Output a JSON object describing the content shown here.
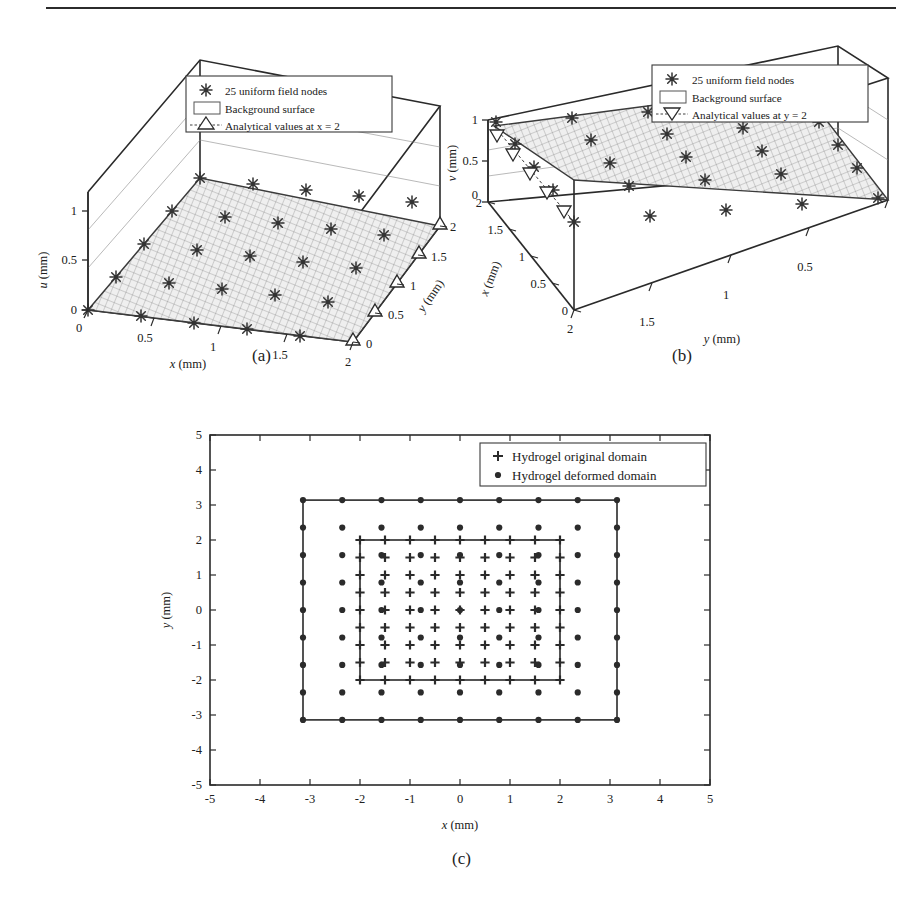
{
  "figure": {
    "top_rule": true,
    "subcaptions": [
      "(a)",
      "(b)",
      "(c)"
    ]
  },
  "panel_a": {
    "caption": "(a)",
    "z_axis": {
      "label": "u",
      "unit": "(mm)",
      "ticks": [
        "0",
        "0.5",
        "1"
      ]
    },
    "x_axis": {
      "label": "x",
      "unit": "(mm)",
      "ticks": [
        "0",
        "0.5",
        "1",
        "1.5",
        "2"
      ]
    },
    "y_axis": {
      "label": "y",
      "unit": "(mm)",
      "ticks": [
        "0",
        "0.5",
        "1",
        "1.5",
        "2"
      ]
    },
    "legend": [
      {
        "marker": "asterisk-marker",
        "label": "25 uniform field nodes"
      },
      {
        "marker": "surface-swatch",
        "label": "Background surface"
      },
      {
        "marker": "up-triangle-marker",
        "label": "Analytical values at x = 2"
      }
    ]
  },
  "panel_b": {
    "caption": "(b)",
    "z_axis": {
      "label": "v",
      "unit": "(mm)",
      "ticks": [
        "0",
        "0.5",
        "1"
      ]
    },
    "x_axis": {
      "label": "x",
      "unit": "(mm)",
      "ticks": [
        "0",
        "0.5",
        "1",
        "1.5",
        "2"
      ]
    },
    "y_axis": {
      "label": "y",
      "unit": "(mm)",
      "ticks": [
        "2",
        "1.5",
        "1",
        "0.5"
      ]
    },
    "legend": [
      {
        "marker": "asterisk-marker",
        "label": "25 uniform field nodes"
      },
      {
        "marker": "surface-swatch",
        "label": "Background surface"
      },
      {
        "marker": "down-triangle-marker",
        "label": "Analytical values at y = 2"
      }
    ]
  },
  "panel_c": {
    "caption": "(c)",
    "x_axis": {
      "label": "x",
      "unit": "(mm)",
      "ticks": [
        "-5",
        "-4",
        "-3",
        "-2",
        "-1",
        "0",
        "1",
        "2",
        "3",
        "4",
        "5"
      ]
    },
    "y_axis": {
      "label": "y",
      "unit": "(mm)",
      "ticks": [
        "-5",
        "-4",
        "-3",
        "-2",
        "-1",
        "0",
        "1",
        "2",
        "3",
        "4",
        "5"
      ]
    },
    "legend": [
      {
        "marker": "plus-marker",
        "label": "Hydrogel original domain"
      },
      {
        "marker": "dot-marker",
        "label": "Hydrogel deformed domain"
      }
    ]
  },
  "chart_data": [
    {
      "id": "panel-a",
      "type": "scatter",
      "title": "",
      "projection": "3d-surface",
      "xlabel": "x (mm)",
      "ylabel": "y (mm)",
      "zlabel": "u (mm)",
      "xlim": [
        0,
        2
      ],
      "ylim": [
        0,
        2
      ],
      "zlim": [
        0,
        1.2
      ],
      "xticks": [
        0,
        0.5,
        1,
        1.5,
        2
      ],
      "yticks": [
        0,
        0.5,
        1,
        1.5,
        2
      ],
      "zticks": [
        0,
        0.5,
        1
      ],
      "grid": true,
      "legend_position": "upper-left-inside",
      "series": [
        {
          "name": "25 uniform field nodes",
          "marker": "asterisk",
          "n": 25,
          "note": "5x5 uniform grid over x=0,0.5,1,1.5,2 and y=0,0.5,1,1.5,2; u = 0.5*x",
          "x": [
            0,
            0,
            0,
            0,
            0,
            0.5,
            0.5,
            0.5,
            0.5,
            0.5,
            1,
            1,
            1,
            1,
            1,
            1.5,
            1.5,
            1.5,
            1.5,
            1.5,
            2,
            2,
            2,
            2,
            2
          ],
          "y": [
            0,
            0.5,
            1,
            1.5,
            2,
            0,
            0.5,
            1,
            1.5,
            2,
            0,
            0.5,
            1,
            1.5,
            2,
            0,
            0.5,
            1,
            1.5,
            2,
            0,
            0.5,
            1,
            1.5,
            2
          ],
          "z": [
            0,
            0,
            0,
            0,
            0,
            0.25,
            0.25,
            0.25,
            0.25,
            0.25,
            0.5,
            0.5,
            0.5,
            0.5,
            0.5,
            0.75,
            0.75,
            0.75,
            0.75,
            0.75,
            1,
            1,
            1,
            1,
            1
          ]
        },
        {
          "name": "Background surface",
          "marker": "mesh",
          "note": "planar mesh surface u = 0.5*x over the 2x2 mm domain"
        },
        {
          "name": "Analytical values at x = 2",
          "marker": "up-triangle",
          "n": 5,
          "x": [
            2,
            2,
            2,
            2,
            2
          ],
          "y": [
            0,
            0.5,
            1,
            1.5,
            2
          ],
          "z": [
            1,
            1,
            1,
            1,
            1
          ]
        }
      ]
    },
    {
      "id": "panel-b",
      "type": "scatter",
      "title": "",
      "projection": "3d-surface",
      "xlabel": "x (mm)",
      "ylabel": "y (mm)",
      "zlabel": "v (mm)",
      "xlim": [
        0,
        2
      ],
      "ylim": [
        0,
        2
      ],
      "zlim": [
        0,
        1.2
      ],
      "xticks": [
        0,
        0.5,
        1,
        1.5,
        2
      ],
      "yticks": [
        0,
        0.5,
        1,
        1.5,
        2
      ],
      "zticks": [
        0,
        0.5,
        1
      ],
      "grid": true,
      "legend_position": "upper-right-inside",
      "series": [
        {
          "name": "25 uniform field nodes",
          "marker": "asterisk",
          "n": 25,
          "note": "5x5 uniform grid; v = 0.5*y",
          "x": [
            0,
            0,
            0,
            0,
            0,
            0.5,
            0.5,
            0.5,
            0.5,
            0.5,
            1,
            1,
            1,
            1,
            1,
            1.5,
            1.5,
            1.5,
            1.5,
            1.5,
            2,
            2,
            2,
            2,
            2
          ],
          "y": [
            0,
            0.5,
            1,
            1.5,
            2,
            0,
            0.5,
            1,
            1.5,
            2,
            0,
            0.5,
            1,
            1.5,
            2,
            0,
            0.5,
            1,
            1.5,
            2,
            0,
            0.5,
            1,
            1.5,
            2
          ],
          "z": [
            0,
            0.25,
            0.5,
            0.75,
            1,
            0,
            0.25,
            0.5,
            0.75,
            1,
            0,
            0.25,
            0.5,
            0.75,
            1,
            0,
            0.25,
            0.5,
            0.75,
            1,
            0,
            0.25,
            0.5,
            0.75,
            1
          ]
        },
        {
          "name": "Background surface",
          "marker": "mesh",
          "note": "planar mesh surface v = 0.5*y over the 2x2 mm domain"
        },
        {
          "name": "Analytical values at y = 2",
          "marker": "down-triangle",
          "n": 5,
          "x": [
            0,
            0.5,
            1,
            1.5,
            2
          ],
          "y": [
            2,
            2,
            2,
            2,
            2
          ],
          "z": [
            1,
            1,
            1,
            1,
            1
          ]
        }
      ]
    },
    {
      "id": "panel-c",
      "type": "scatter",
      "title": "",
      "xlabel": "x (mm)",
      "ylabel": "y (mm)",
      "xlim": [
        -5,
        5
      ],
      "ylim": [
        -5,
        5
      ],
      "xticks": [
        -5,
        -4,
        -3,
        -2,
        -1,
        0,
        1,
        2,
        3,
        4,
        5
      ],
      "yticks": [
        -5,
        -4,
        -3,
        -2,
        -1,
        0,
        1,
        2,
        3,
        4,
        5
      ],
      "grid": false,
      "legend_position": "upper-right-inside",
      "series": [
        {
          "name": "Hydrogel original domain",
          "marker": "plus",
          "n": 81,
          "note": "9x9 uniform grid, spacing 0.5 mm, spanning -2..2 in both x and y; outlined by inner square box from (-2,-2) to (2,2)",
          "grid_coords": [
            -2,
            -1.5,
            -1,
            -0.5,
            0,
            0.5,
            1,
            1.5,
            2
          ],
          "box": [
            -2,
            -2,
            2,
            2
          ]
        },
        {
          "name": "Hydrogel deformed domain",
          "marker": "dot",
          "n": 81,
          "note": "9x9 uniform grid, spacing ~0.785 mm, spanning -3.14..3.14 in both x and y; outlined by outer square box from (-3.14,-3.14) to (3.14,3.14)",
          "grid_coords": [
            -3.14,
            -2.355,
            -1.57,
            -0.785,
            0,
            0.785,
            1.57,
            2.355,
            3.14
          ],
          "box": [
            -3.14,
            -3.14,
            3.14,
            3.14
          ]
        }
      ]
    }
  ]
}
